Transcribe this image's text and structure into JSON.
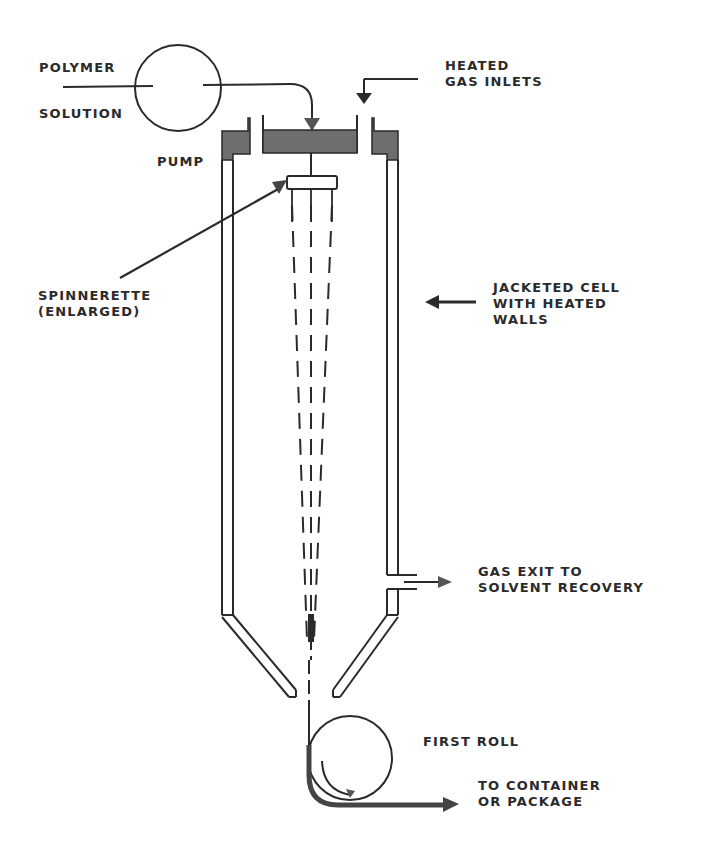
{
  "diagram": {
    "type": "process-schematic"
  },
  "labels": {
    "polymer": "POLYMER",
    "solution": "SOLUTION",
    "pump": "PUMP",
    "heated_gas_1": "HEATED",
    "heated_gas_2": "GAS INLETS",
    "spinnerette_1": "SPINNERETTE",
    "spinnerette_2": "(ENLARGED)",
    "jacketed_1": "JACKETED CELL",
    "jacketed_2": "WITH HEATED",
    "jacketed_3": "WALLS",
    "gas_exit_1": "GAS EXIT TO",
    "gas_exit_2": "SOLVENT RECOVERY",
    "first_roll": "FIRST ROLL",
    "container_1": "TO CONTAINER",
    "container_2": "OR PACKAGE"
  },
  "colors": {
    "ink": "#2a2a2a",
    "fill": "#6e6e6e",
    "background": "#ffffff"
  }
}
